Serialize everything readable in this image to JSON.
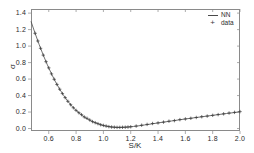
{
  "chart_data": {
    "type": "line",
    "title": "",
    "xlabel": "S/K",
    "ylabel": "σ",
    "xlim": [
      0.47,
      2.0
    ],
    "ylim": [
      -0.03,
      1.45
    ],
    "xticks": [
      "0.6",
      "0.8",
      "1.0",
      "1.2",
      "1.4",
      "1.6",
      "1.8",
      "2.0"
    ],
    "xtick_values": [
      0.6,
      0.8,
      1.0,
      1.2,
      1.4,
      1.6,
      1.8,
      2.0
    ],
    "yticks": [
      "0.0",
      "0.2",
      "0.4",
      "0.6",
      "0.8",
      "1.0",
      "1.2",
      "1.4"
    ],
    "ytick_values": [
      0.0,
      0.2,
      0.4,
      0.6,
      0.8,
      1.0,
      1.2,
      1.4
    ],
    "grid": false,
    "legend_position": "top-right",
    "series": [
      {
        "name": "NN",
        "marker": "line",
        "color": "#4a4a4a",
        "x": [
          0.47,
          0.5,
          0.53,
          0.56,
          0.59,
          0.62,
          0.65,
          0.68,
          0.71,
          0.74,
          0.77,
          0.8,
          0.83,
          0.86,
          0.89,
          0.92,
          0.95,
          0.98,
          1.01,
          1.04,
          1.07,
          1.1,
          1.13,
          1.16,
          1.19,
          1.22,
          1.25,
          1.3,
          1.35,
          1.4,
          1.45,
          1.5,
          1.55,
          1.6,
          1.65,
          1.7,
          1.75,
          1.8,
          1.85,
          1.9,
          1.95,
          2.0
        ],
        "y": [
          1.3,
          1.155,
          1.018,
          0.89,
          0.772,
          0.663,
          0.565,
          0.477,
          0.399,
          0.33,
          0.271,
          0.22,
          0.177,
          0.14,
          0.11,
          0.084,
          0.063,
          0.046,
          0.033,
          0.023,
          0.017,
          0.014,
          0.014,
          0.016,
          0.02,
          0.025,
          0.031,
          0.043,
          0.055,
          0.068,
          0.08,
          0.092,
          0.104,
          0.116,
          0.127,
          0.138,
          0.149,
          0.16,
          0.171,
          0.182,
          0.192,
          0.203
        ]
      },
      {
        "name": "data",
        "marker": "+",
        "color": "#3a3a3a",
        "x": [
          0.5,
          0.52,
          0.54,
          0.56,
          0.58,
          0.6,
          0.62,
          0.64,
          0.66,
          0.68,
          0.7,
          0.72,
          0.74,
          0.76,
          0.78,
          0.8,
          0.82,
          0.84,
          0.86,
          0.88,
          0.9,
          0.92,
          0.94,
          0.96,
          0.98,
          1.0,
          1.02,
          1.04,
          1.06,
          1.08,
          1.1,
          1.12,
          1.14,
          1.16,
          1.18,
          1.2,
          1.24,
          1.28,
          1.32,
          1.36,
          1.4,
          1.44,
          1.48,
          1.52,
          1.56,
          1.6,
          1.64,
          1.68,
          1.72,
          1.76,
          1.8,
          1.84,
          1.88,
          1.92,
          1.96,
          2.0
        ],
        "y": [
          1.155,
          1.062,
          0.973,
          0.89,
          0.811,
          0.736,
          0.663,
          0.597,
          0.535,
          0.477,
          0.424,
          0.375,
          0.33,
          0.289,
          0.252,
          0.22,
          0.192,
          0.168,
          0.14,
          0.124,
          0.104,
          0.084,
          0.071,
          0.059,
          0.046,
          0.038,
          0.03,
          0.023,
          0.018,
          0.016,
          0.014,
          0.014,
          0.015,
          0.016,
          0.018,
          0.021,
          0.03,
          0.04,
          0.05,
          0.061,
          0.068,
          0.078,
          0.089,
          0.096,
          0.108,
          0.116,
          0.124,
          0.134,
          0.143,
          0.151,
          0.16,
          0.169,
          0.178,
          0.188,
          0.196,
          0.205
        ]
      }
    ]
  },
  "legend": {
    "items": [
      {
        "label": "NN",
        "key": "line-key"
      },
      {
        "label": "data",
        "key": "plus-key"
      }
    ]
  },
  "axes": {
    "x_axis_label": "S/K",
    "y_axis_label": "σ"
  }
}
